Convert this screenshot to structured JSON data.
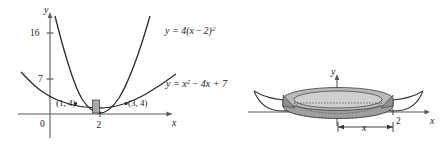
{
  "figure": {
    "background_color": "#ffffff",
    "ink_color": "#2b2b2b",
    "shade_color": "#a9a9a9",
    "panels": [
      {
        "name": "left-panel-graph",
        "description": "Cartesian graph of two parabolas with shaded representative rectangle",
        "axes": {
          "y_axis_label": "y",
          "x_axis_label": "x",
          "origin_label": "0",
          "y_ticks": [
            "16",
            "7"
          ],
          "x_ticks": [
            "2"
          ]
        },
        "curves": [
          {
            "id": "curve-narrow",
            "equation_label": "y = 4(x − 2)²",
            "base": "y = 4(x ",
            "mid": "2)",
            "exp": "2"
          },
          {
            "id": "curve-wide",
            "equation_label": "y = x² − 4x + 7",
            "base": "y = x",
            "exp": "2",
            "tail": "− 4x + 7"
          }
        ],
        "point_labels": [
          "(1, 4)",
          "(3, 4)"
        ],
        "shaded_strip": {
          "name": "representative-rectangle",
          "fill": "#a9a9a9"
        }
      },
      {
        "name": "right-panel-solid",
        "description": "Solid of revolution (washer) generated by rotating the region about the y-axis",
        "axes": {
          "y_axis_label": "y",
          "x_axis_label": "x",
          "x_ticks": [
            "2"
          ]
        },
        "dimension_label": "x"
      }
    ]
  },
  "equations": {
    "eq1_prefix": "y = 4(x",
    "eq1_minus": "−",
    "eq1_mid": "2)",
    "eq1_exp": "2",
    "eq2_prefix": "y = x",
    "eq2_exp": "2",
    "eq2_rest": "− 4x + 7"
  },
  "labels": {
    "y_axis": "y",
    "x_axis": "x",
    "origin": "0",
    "tick_16": "16",
    "tick_7": "7",
    "tick_2": "2",
    "point_left": "(1, 4)",
    "point_right": "(3, 4)",
    "dimension_x": "x",
    "right_tick_2": "2",
    "right_y": "y",
    "right_x": "x"
  }
}
